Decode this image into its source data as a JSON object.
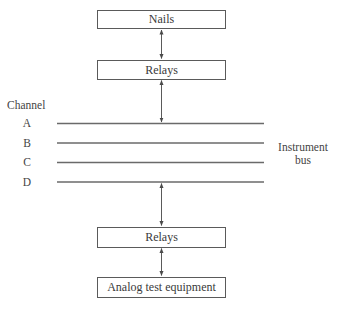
{
  "diagram": {
    "type": "block-diagram",
    "blocks": [
      {
        "id": "nails",
        "label": "Nails"
      },
      {
        "id": "relays_top",
        "label": "Relays"
      },
      {
        "id": "relays_bottom",
        "label": "Relays"
      },
      {
        "id": "analog",
        "label": "Analog test equipment"
      }
    ],
    "channel_heading": "Channel",
    "channels": [
      "A",
      "B",
      "C",
      "D"
    ],
    "bus_label_line1": "Instrument",
    "bus_label_line2": "bus",
    "connections": [
      {
        "from": "nails",
        "to": "relays_top",
        "type": "bidirectional"
      },
      {
        "from": "relays_top",
        "to": "instrument_bus",
        "type": "bidirectional"
      },
      {
        "from": "instrument_bus",
        "to": "relays_bottom",
        "type": "bidirectional"
      },
      {
        "from": "relays_bottom",
        "to": "analog",
        "type": "bidirectional"
      }
    ],
    "colors": {
      "line": "#5a5a5a",
      "text": "#3a3a3a",
      "background": "#ffffff"
    }
  }
}
